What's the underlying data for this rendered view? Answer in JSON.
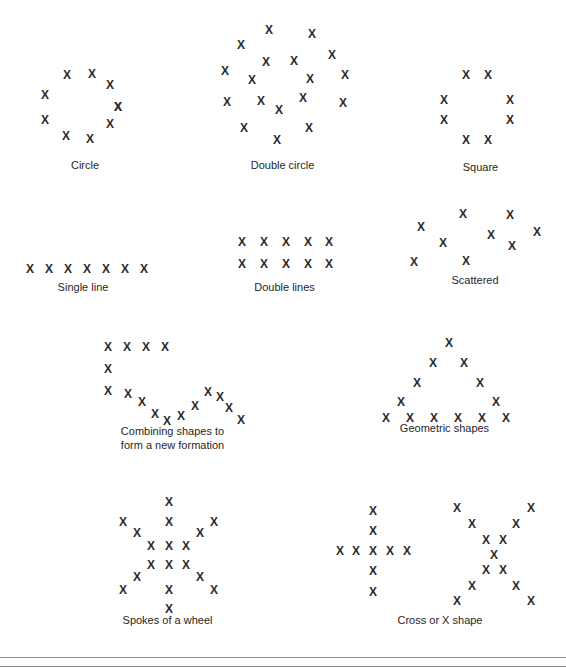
{
  "figure": {
    "mark_glyph": "X",
    "mark_color": "#2b2b2b",
    "background_color": "#ffffff",
    "rule_color": "#8f8f8f",
    "width": 566,
    "height": 667
  },
  "patterns": [
    {
      "id": "circle",
      "label": "Circle",
      "count": 10,
      "box": {
        "x": 20,
        "y": 58,
        "w": 130,
        "h": 95
      },
      "label_y": 100,
      "marks": [
        {
          "x": 47,
          "y": 17
        },
        {
          "x": 72,
          "y": 16
        },
        {
          "x": 90,
          "y": 27
        },
        {
          "x": 25,
          "y": 37
        },
        {
          "x": 98,
          "y": 49
        },
        {
          "x": 25,
          "y": 62
        },
        {
          "x": 90,
          "y": 66
        },
        {
          "x": 46,
          "y": 78
        },
        {
          "x": 70,
          "y": 81
        },
        {
          "x": 98,
          "y": 49
        }
      ]
    },
    {
      "id": "double-circle",
      "label": "Double circle",
      "count": 21,
      "box": {
        "x": 215,
        "y": 18,
        "w": 135,
        "h": 135
      },
      "label_y": 140,
      "marks": [
        {
          "x": 54,
          "y": 12
        },
        {
          "x": 97,
          "y": 16
        },
        {
          "x": 26,
          "y": 27
        },
        {
          "x": 117,
          "y": 37
        },
        {
          "x": 51,
          "y": 44
        },
        {
          "x": 79,
          "y": 43
        },
        {
          "x": 10,
          "y": 53
        },
        {
          "x": 130,
          "y": 57
        },
        {
          "x": 37,
          "y": 62
        },
        {
          "x": 95,
          "y": 61
        },
        {
          "x": 12,
          "y": 84
        },
        {
          "x": 46,
          "y": 83
        },
        {
          "x": 88,
          "y": 80
        },
        {
          "x": 128,
          "y": 85
        },
        {
          "x": 64,
          "y": 92
        },
        {
          "x": 29,
          "y": 110
        },
        {
          "x": 94,
          "y": 110
        },
        {
          "x": 62,
          "y": 122
        }
      ]
    },
    {
      "id": "square",
      "label": "Square",
      "count": 8,
      "box": {
        "x": 428,
        "y": 60,
        "w": 105,
        "h": 90
      },
      "label_y": 100,
      "marks": [
        {
          "x": 38,
          "y": 15
        },
        {
          "x": 60,
          "y": 15
        },
        {
          "x": 16,
          "y": 40
        },
        {
          "x": 82,
          "y": 40
        },
        {
          "x": 16,
          "y": 60
        },
        {
          "x": 82,
          "y": 60
        },
        {
          "x": 38,
          "y": 80
        },
        {
          "x": 60,
          "y": 80
        }
      ]
    },
    {
      "id": "single-line",
      "label": "Single line",
      "count": 7,
      "box": {
        "x": 18,
        "y": 258,
        "w": 130,
        "h": 22
      },
      "label_y": 22,
      "marks": [
        {
          "x": 12,
          "y": 11
        },
        {
          "x": 31,
          "y": 11
        },
        {
          "x": 50,
          "y": 11
        },
        {
          "x": 69,
          "y": 11
        },
        {
          "x": 88,
          "y": 11
        },
        {
          "x": 107,
          "y": 11
        },
        {
          "x": 126,
          "y": 11
        }
      ]
    },
    {
      "id": "double-lines",
      "label": "Double lines",
      "count": 10,
      "box": {
        "x": 232,
        "y": 232,
        "w": 105,
        "h": 48
      },
      "label_y": 48,
      "marks": [
        {
          "x": 10,
          "y": 10
        },
        {
          "x": 32,
          "y": 10
        },
        {
          "x": 54,
          "y": 10
        },
        {
          "x": 76,
          "y": 10
        },
        {
          "x": 97,
          "y": 10
        },
        {
          "x": 10,
          "y": 32
        },
        {
          "x": 32,
          "y": 32
        },
        {
          "x": 54,
          "y": 32
        },
        {
          "x": 76,
          "y": 32
        },
        {
          "x": 97,
          "y": 32
        }
      ]
    },
    {
      "id": "scattered",
      "label": "Scattered",
      "count": 9,
      "box": {
        "x": 405,
        "y": 205,
        "w": 140,
        "h": 70
      },
      "label_y": 68,
      "marks": [
        {
          "x": 58,
          "y": 9
        },
        {
          "x": 105,
          "y": 10
        },
        {
          "x": 16,
          "y": 22
        },
        {
          "x": 86,
          "y": 30
        },
        {
          "x": 132,
          "y": 27
        },
        {
          "x": 38,
          "y": 38
        },
        {
          "x": 107,
          "y": 41
        },
        {
          "x": 61,
          "y": 56
        },
        {
          "x": 9,
          "y": 57
        }
      ]
    },
    {
      "id": "combining-shapes",
      "label": "Combining shapes to\nform a new formation",
      "count": 18,
      "box": {
        "x": 95,
        "y": 338,
        "w": 155,
        "h": 85
      },
      "label_y": 86,
      "marks": [
        {
          "x": 13,
          "y": 9
        },
        {
          "x": 32,
          "y": 9
        },
        {
          "x": 51,
          "y": 9
        },
        {
          "x": 70,
          "y": 9
        },
        {
          "x": 13,
          "y": 31
        },
        {
          "x": 13,
          "y": 53
        },
        {
          "x": 33,
          "y": 56
        },
        {
          "x": 47,
          "y": 64
        },
        {
          "x": 60,
          "y": 76
        },
        {
          "x": 72,
          "y": 83
        },
        {
          "x": 86,
          "y": 78
        },
        {
          "x": 100,
          "y": 68
        },
        {
          "x": 113,
          "y": 54
        },
        {
          "x": 125,
          "y": 59
        },
        {
          "x": 134,
          "y": 70
        },
        {
          "x": 146,
          "y": 82
        }
      ]
    },
    {
      "id": "geometric-shapes",
      "label": "Geometric shapes",
      "count": 12,
      "box": {
        "x": 372,
        "y": 335,
        "w": 145,
        "h": 85
      },
      "label_y": 86,
      "marks": [
        {
          "x": 77,
          "y": 8
        },
        {
          "x": 61,
          "y": 28
        },
        {
          "x": 92,
          "y": 28
        },
        {
          "x": 45,
          "y": 48
        },
        {
          "x": 108,
          "y": 48
        },
        {
          "x": 29,
          "y": 67
        },
        {
          "x": 124,
          "y": 67
        },
        {
          "x": 14,
          "y": 83
        },
        {
          "x": 38,
          "y": 83
        },
        {
          "x": 62,
          "y": 83
        },
        {
          "x": 86,
          "y": 83
        },
        {
          "x": 110,
          "y": 83
        },
        {
          "x": 134,
          "y": 83
        }
      ]
    },
    {
      "id": "spokes-of-a-wheel",
      "label": "Spokes of a wheel",
      "count": 24,
      "box": {
        "x": 110,
        "y": 495,
        "w": 115,
        "h": 115
      },
      "label_y": 118,
      "marks": [
        {
          "x": 59,
          "y": 7
        },
        {
          "x": 13,
          "y": 27
        },
        {
          "x": 59,
          "y": 27
        },
        {
          "x": 104,
          "y": 27
        },
        {
          "x": 27,
          "y": 38
        },
        {
          "x": 90,
          "y": 38
        },
        {
          "x": 41,
          "y": 51
        },
        {
          "x": 59,
          "y": 51
        },
        {
          "x": 76,
          "y": 51
        },
        {
          "x": 41,
          "y": 70
        },
        {
          "x": 59,
          "y": 70
        },
        {
          "x": 76,
          "y": 70
        },
        {
          "x": 27,
          "y": 82
        },
        {
          "x": 90,
          "y": 82
        },
        {
          "x": 13,
          "y": 95
        },
        {
          "x": 59,
          "y": 95
        },
        {
          "x": 104,
          "y": 95
        },
        {
          "x": 59,
          "y": 114
        }
      ]
    },
    {
      "id": "cross-or-x-shape",
      "label": "Cross or X shape",
      "count": 18,
      "box": {
        "x": 335,
        "y": 500,
        "w": 210,
        "h": 110
      },
      "label_y": 113,
      "marks": [
        {
          "x": 38,
          "y": 11
        },
        {
          "x": 38,
          "y": 31
        },
        {
          "x": 5,
          "y": 51
        },
        {
          "x": 21,
          "y": 51
        },
        {
          "x": 38,
          "y": 51
        },
        {
          "x": 55,
          "y": 51
        },
        {
          "x": 72,
          "y": 51
        },
        {
          "x": 38,
          "y": 71
        },
        {
          "x": 38,
          "y": 92
        },
        {
          "x": 122,
          "y": 8
        },
        {
          "x": 196,
          "y": 8
        },
        {
          "x": 137,
          "y": 24
        },
        {
          "x": 181,
          "y": 24
        },
        {
          "x": 151,
          "y": 40
        },
        {
          "x": 168,
          "y": 40
        },
        {
          "x": 159,
          "y": 55
        },
        {
          "x": 151,
          "y": 70
        },
        {
          "x": 168,
          "y": 70
        },
        {
          "x": 137,
          "y": 86
        },
        {
          "x": 181,
          "y": 86
        },
        {
          "x": 122,
          "y": 101
        },
        {
          "x": 196,
          "y": 101
        }
      ]
    }
  ]
}
